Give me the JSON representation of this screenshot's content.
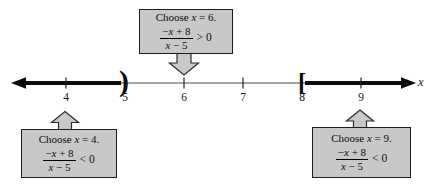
{
  "figure": {
    "axis_label": "x",
    "tick_labels": [
      "4",
      "5",
      "6",
      "7",
      "8",
      "9"
    ],
    "open_interval_symbol": ")",
    "closed_interval_symbol": "[",
    "colors": {
      "thin_line": "#4a4a4a",
      "bold_line": "#0a0a0a",
      "box_fill": "#c8c8c8",
      "box_border": "#1c1c1c",
      "arrow_fill": "#c9c9c9",
      "arrow_border": "#2e2e2e"
    }
  },
  "callouts": {
    "top": {
      "choose_pre": "Choose",
      "choose_var": "x",
      "choose_post": " = 6.",
      "num_pre": "−",
      "num_var": "x",
      "num_post": " + 8",
      "den_var": "x",
      "den_post": " − 5",
      "relation": "> 0"
    },
    "bottom_left": {
      "choose_pre": "Choose",
      "choose_var": "x",
      "choose_post": " = 4.",
      "num_pre": "−",
      "num_var": "x",
      "num_post": " + 8",
      "den_var": "x",
      "den_post": " − 5",
      "relation": "< 0"
    },
    "bottom_right": {
      "choose_pre": "Choose",
      "choose_var": "x",
      "choose_post": " = 9.",
      "num_pre": "−",
      "num_var": "x",
      "num_post": " + 8",
      "den_var": "x",
      "den_post": " − 5",
      "relation": "< 0"
    }
  }
}
